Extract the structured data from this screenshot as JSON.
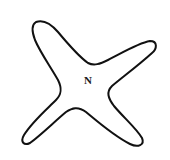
{
  "diagram": {
    "shape": "four-armed star outline",
    "center_label": "N",
    "stroke_color": "#111111",
    "fill_color": "#ffffff",
    "background": "#ffffff"
  }
}
